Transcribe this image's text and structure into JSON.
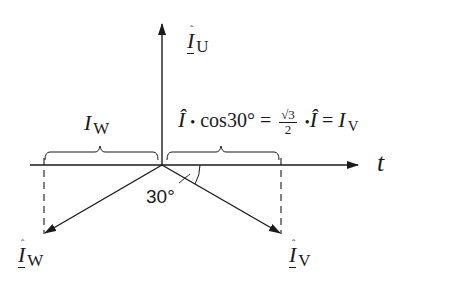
{
  "diagram": {
    "colors": {
      "line": "#1a1a1a",
      "background": "#ffffff"
    },
    "axis": {
      "label": "t"
    },
    "phasors": {
      "u": {
        "symbol": "Î",
        "subscript": "U"
      },
      "v": {
        "symbol": "Î",
        "subscript": "V"
      },
      "w": {
        "symbol": "Î",
        "subscript": "W"
      }
    },
    "projections": {
      "w": {
        "symbol": "I",
        "subscript": "W"
      },
      "v_formula": {
        "i_hat": "Î",
        "dot1": "•",
        "cos_text": "cos30°",
        "eq1": "=",
        "frac_num": "√3",
        "frac_den": "2",
        "dot2": "•",
        "i_hat2": "Î",
        "eq2": "=",
        "result_symbol": "I",
        "result_subscript": "V"
      }
    },
    "angle": {
      "label": "30°"
    }
  }
}
